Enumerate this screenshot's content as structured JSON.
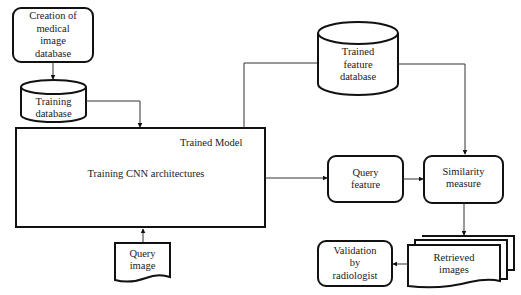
{
  "diagram": {
    "nodes": {
      "creation": {
        "label_lines": [
          "Creation of",
          "medical",
          "image",
          "database"
        ],
        "shape": "rounded-rect"
      },
      "training_db": {
        "label_lines": [
          "Training",
          "database"
        ],
        "shape": "cylinder"
      },
      "trained_model": {
        "title": "Trained Model",
        "body": "Training CNN architectures",
        "shape": "rect"
      },
      "query_image": {
        "label_lines": [
          "Query",
          "image"
        ],
        "shape": "document"
      },
      "trained_feature_db": {
        "label_lines": [
          "Trained",
          "feature",
          "database"
        ],
        "shape": "cylinder"
      },
      "query_feature": {
        "label_lines": [
          "Query",
          "feature"
        ],
        "shape": "rounded-rect"
      },
      "similarity": {
        "label_lines": [
          "Similarity",
          "measure"
        ],
        "shape": "rounded-rect"
      },
      "retrieved": {
        "label_lines": [
          "Retrieved",
          "images"
        ],
        "shape": "multi-document"
      },
      "validation": {
        "label_lines": [
          "Validation",
          "by",
          "radiologist"
        ],
        "shape": "rounded-rect"
      }
    },
    "edges": [
      {
        "from": "creation",
        "to": "training_db"
      },
      {
        "from": "training_db",
        "to": "trained_model"
      },
      {
        "from": "query_image",
        "to": "trained_model"
      },
      {
        "from": "trained_model",
        "to": "trained_feature_db",
        "arrow": false
      },
      {
        "from": "trained_model",
        "to": "query_feature"
      },
      {
        "from": "trained_feature_db",
        "to": "similarity"
      },
      {
        "from": "query_feature",
        "to": "similarity"
      },
      {
        "from": "similarity",
        "to": "retrieved"
      },
      {
        "from": "retrieved",
        "to": "validation"
      }
    ]
  }
}
